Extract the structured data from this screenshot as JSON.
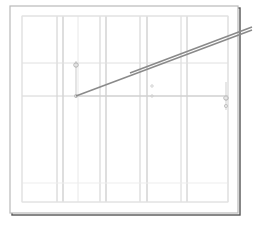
{
  "document": {
    "title": "Technical Line Drawing",
    "background_color": "#ffffff",
    "width": 254,
    "height": 227
  },
  "frame": {
    "name": "outer-frame",
    "x": 10,
    "y": 6,
    "width": 228,
    "height": 207,
    "stroke_color": "#b9b9b9",
    "shadow_color": "#555555",
    "shadow_offset": 2
  },
  "inner_frame": {
    "name": "inner-plot-area",
    "x": 22,
    "y": 16,
    "width": 206,
    "height": 186,
    "stroke_color": "#e2e2e2"
  },
  "chart_data": {
    "type": "line",
    "subtitle": "",
    "xlabel": "",
    "ylabel": "",
    "grid": true,
    "legend": "none",
    "xlim": [
      22,
      228
    ],
    "ylim": [
      16,
      202
    ],
    "categories": [],
    "vertical_gridlines": [
      {
        "x": 22,
        "color": "#e2e2e2",
        "width": 1
      },
      {
        "x": 57,
        "color": "#cccccc",
        "width": 1
      },
      {
        "x": 63,
        "color": "#bdbdbd",
        "width": 1
      },
      {
        "x": 78,
        "color": "#e8e8e8",
        "width": 1
      },
      {
        "x": 100,
        "color": "#cfcfcf",
        "width": 1
      },
      {
        "x": 106,
        "color": "#bdbdbd",
        "width": 1
      },
      {
        "x": 140,
        "color": "#cfcfcf",
        "width": 1
      },
      {
        "x": 147,
        "color": "#bdbdbd",
        "width": 1
      },
      {
        "x": 181,
        "color": "#d6d6d6",
        "width": 1
      },
      {
        "x": 187,
        "color": "#c4c4c4",
        "width": 1
      },
      {
        "x": 228,
        "color": "#d9d9d9",
        "width": 1
      }
    ],
    "horizontal_gridlines": [
      {
        "y": 16,
        "color": "#e2e2e2",
        "width": 1
      },
      {
        "y": 63,
        "color": "#e0e0e0",
        "width": 1
      },
      {
        "y": 96,
        "color": "#d4d4d4",
        "width": 1
      },
      {
        "y": 183,
        "color": "#ededed",
        "width": 1
      },
      {
        "y": 202,
        "color": "#e2e2e2",
        "width": 1
      }
    ],
    "series": [
      {
        "name": "primary-diagonal",
        "type": "segment",
        "points": [
          [
            76,
            96
          ],
          [
            252,
            30
          ]
        ],
        "color": "#8a8a8a",
        "width": 1.6
      },
      {
        "name": "secondary-diagonal",
        "type": "segment",
        "points": [
          [
            130,
            73
          ],
          [
            252,
            27
          ]
        ],
        "color": "#8a8a8a",
        "width": 1.6
      }
    ],
    "markers": [
      {
        "name": "left-control-stem",
        "type": "vline",
        "x": 76,
        "y1": 61,
        "y2": 98,
        "color": "#c9c9c9",
        "width": 1
      },
      {
        "name": "left-control-handle",
        "type": "circle",
        "x": 76,
        "y": 65,
        "r": 2.2,
        "color": "#b0b0b0"
      },
      {
        "name": "left-control-anchor",
        "type": "circle",
        "x": 76,
        "y": 96,
        "r": 1.6,
        "color": "#c0c0c0"
      },
      {
        "name": "right-control-stem",
        "type": "vline",
        "x": 226,
        "y1": 82,
        "y2": 110,
        "color": "#cfcfcf",
        "width": 1
      },
      {
        "name": "right-control-handle",
        "type": "circle",
        "x": 226,
        "y": 98,
        "r": 2.2,
        "color": "#b0b0b0"
      },
      {
        "name": "right-control-anchor",
        "type": "circle",
        "x": 226,
        "y": 106,
        "r": 1.6,
        "color": "#c4c4c4"
      },
      {
        "name": "mid-reference-dot",
        "type": "circle",
        "x": 152,
        "y": 86,
        "r": 1.2,
        "color": "#d0d0d0"
      },
      {
        "name": "mid-baseline-dot",
        "type": "circle",
        "x": 152,
        "y": 96,
        "r": 1.2,
        "color": "#d0d0d0"
      },
      {
        "name": "baseline-span",
        "type": "hline",
        "x1": 76,
        "x2": 228,
        "y": 96,
        "color": "#cfcfcf",
        "width": 1
      }
    ],
    "annotations": [],
    "values": [],
    "x": []
  }
}
